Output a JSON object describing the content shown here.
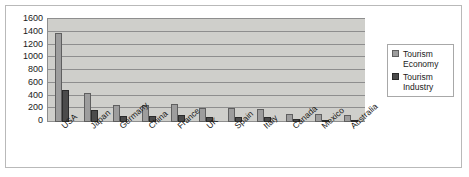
{
  "chart_data": {
    "type": "bar",
    "title": "",
    "xlabel": "",
    "ylabel": "",
    "ylim": [
      0,
      1600
    ],
    "ytick_step": 200,
    "yticks": [
      "1600",
      "1400",
      "1200",
      "1000",
      "800",
      "600",
      "400",
      "200",
      "0"
    ],
    "grid": true,
    "legend_position": "right",
    "categories": [
      "USA",
      "Japan",
      "Germany",
      "China",
      "France",
      "UK",
      "Spain",
      "Italy",
      "Canada",
      "Mexico",
      "Australia"
    ],
    "series": [
      {
        "name": "Tourism Economy",
        "color": "#9d9d9d",
        "values": [
          1400,
          450,
          270,
          260,
          280,
          215,
          215,
          210,
          130,
          120,
          110
        ]
      },
      {
        "name": "Tourism Industry",
        "color": "#4b4b4b",
        "values": [
          500,
          185,
          100,
          90,
          105,
          80,
          80,
          75,
          40,
          35,
          35
        ]
      }
    ]
  },
  "legend": {
    "entries": [
      {
        "label_line1": "Tourism",
        "label_line2": "Economy",
        "swatch": "economy-swatch"
      },
      {
        "label_line1": "Tourism",
        "label_line2": "Industry",
        "swatch": "industry-swatch"
      }
    ]
  },
  "colors": {
    "series_economy": "#9d9d9d",
    "series_industry": "#4b4b4b",
    "plot_background": "#cfcfcb",
    "gridline": "#8e8e8e",
    "axis": "#8e8e8e",
    "frame_border": "#b9b9b9",
    "text": "#1a1a1a"
  }
}
